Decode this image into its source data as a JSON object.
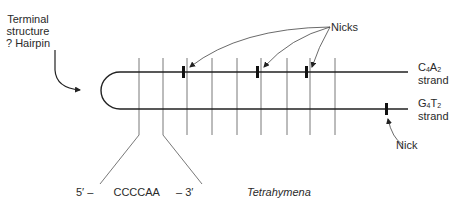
{
  "labels": {
    "terminal_line1": "Terminal",
    "terminal_line2": "structure",
    "terminal_line3": "? Hairpin",
    "nicks": "Nicks",
    "nick": "Nick",
    "top_strand_base1": "C",
    "top_strand_sub1": "4",
    "top_strand_base2": "A",
    "top_strand_sub2": "2",
    "top_strand_word": "strand",
    "bottom_strand_base1": "G",
    "bottom_strand_sub1": "4",
    "bottom_strand_base2": "T",
    "bottom_strand_sub2": "2",
    "bottom_strand_word": "strand",
    "seq_5prime": "5′ –",
    "seq_repeat": "CCCCAA",
    "seq_3prime": "– 3′",
    "organism": "Tetrahymena"
  },
  "structure": {
    "repeat_count": 9,
    "top_strand_nicks": 3,
    "bottom_strand_nicks": 1
  }
}
